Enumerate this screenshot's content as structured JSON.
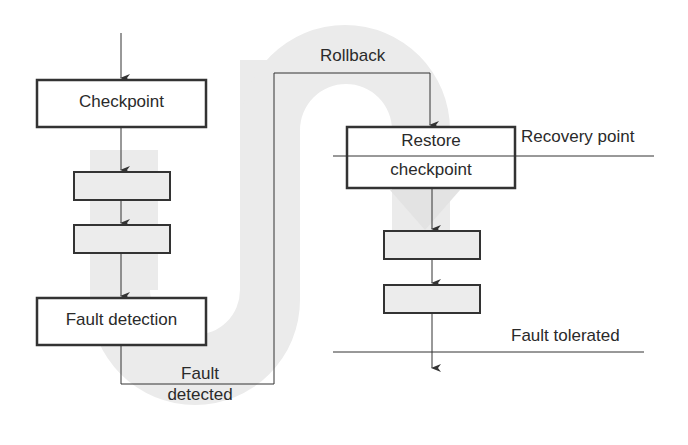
{
  "diagram": {
    "type": "rollback-recovery-flow",
    "colors": {
      "band": "#ebebeb",
      "line": "#333333",
      "box_fill_shaded": "#ececec",
      "box_fill_plain": "#ffffff"
    },
    "boxes": {
      "checkpoint": "Checkpoint",
      "fault_detection": "Fault detection",
      "restore_line1": "Restore",
      "restore_line2": "checkpoint"
    },
    "labels": {
      "rollback": "Rollback",
      "recovery_point": "Recovery point",
      "fault_detected_line1": "Fault",
      "fault_detected_line2": "detected",
      "fault_tolerated": "Fault tolerated"
    }
  }
}
